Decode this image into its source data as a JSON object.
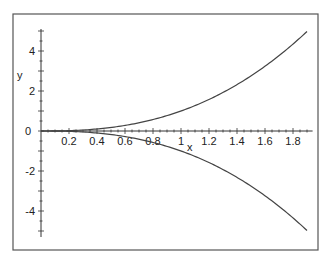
{
  "chart_data": {
    "type": "line",
    "title": "",
    "xlabel": "x",
    "ylabel": "y",
    "xlim": [
      0,
      1.94
    ],
    "ylim": [
      -5.3,
      5.1
    ],
    "x_ticks": [
      0.2,
      0.4,
      0.6,
      0.8,
      1,
      1.2,
      1.4,
      1.6,
      1.8
    ],
    "x_tick_labels": [
      "0.2",
      "0.4",
      "0.6",
      "0.8",
      "1",
      "1.2",
      "1.4",
      "1.6",
      "1.8"
    ],
    "y_ticks": [
      -4,
      -2,
      0,
      2,
      4
    ],
    "y_tick_labels": [
      "-4",
      "-2",
      "0",
      "2",
      "4"
    ],
    "grid": false,
    "legend": null,
    "series": [
      {
        "name": "upper",
        "formula": "y = x^(5/2)",
        "x": [
          0,
          0.2,
          0.4,
          0.6,
          0.8,
          1.0,
          1.2,
          1.4,
          1.6,
          1.8,
          1.9
        ],
        "y": [
          0,
          0.02,
          0.1,
          0.28,
          0.57,
          1.0,
          1.58,
          2.32,
          3.24,
          4.35,
          4.98
        ]
      },
      {
        "name": "lower",
        "formula": "y = -x^(5/2)",
        "x": [
          0,
          0.2,
          0.4,
          0.6,
          0.8,
          1.0,
          1.2,
          1.4,
          1.6,
          1.8,
          1.9
        ],
        "y": [
          0,
          -0.02,
          -0.1,
          -0.28,
          -0.57,
          -1.0,
          -1.58,
          -2.32,
          -3.24,
          -4.35,
          -4.98
        ]
      }
    ]
  },
  "labels": {
    "x_axis": "x",
    "y_axis": "y"
  }
}
